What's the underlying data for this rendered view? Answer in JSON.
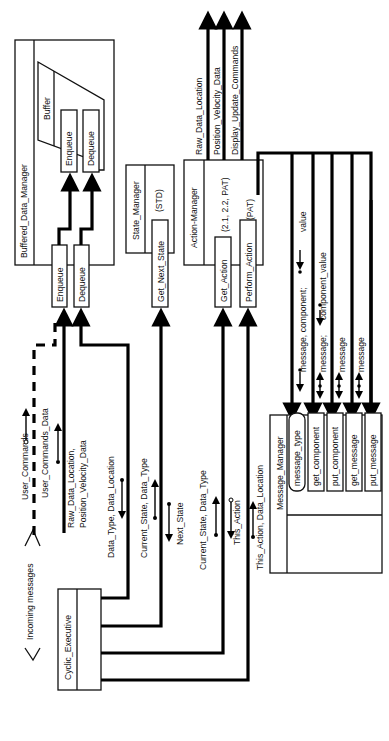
{
  "diagram": {
    "type": "structure-chart",
    "orientation": "rotated-90-ccw",
    "modules": {
      "cyclic_executive": "Cyclic_Executive",
      "buffered_data_manager": "Buffered_Data_Manager",
      "buffer": "Buffer",
      "bdm_enqueue": "Enqueue",
      "bdm_dequeue": "Dequeue",
      "enqueue": "Enqueue",
      "dequeue": "Dequeue",
      "state_manager": "State_Manager",
      "state_manager_note": "(STD)",
      "get_next_state": "Get_Next_State",
      "action_manager": "Action-Manager",
      "action_manager_note1": "(2.1, 2.2, PAT)",
      "action_manager_note2": "(PAT)",
      "get_action": "Get_Action",
      "perform_action": "Perform_Action",
      "message_manager": "Message_Manager",
      "message_type": "message_type",
      "get_component": "get_component",
      "put_component": "put_component",
      "get_message": "get_message",
      "put_message": "put_message"
    },
    "labels": {
      "incoming_messages": "Incoming messages",
      "user_commands": "User_Commands",
      "user_commands_data": "User_Commands_Data",
      "raw_pos_1": "Raw_Data_Location,",
      "raw_pos_2": "Position_Velocity_Data",
      "data_type_location": "Data_Type, Data_Location",
      "current_state_data_type_1": "Current_State, Data_Type",
      "next_state": "Next_State",
      "current_state_data_type_2": "Current_State, Data_Type",
      "this_action": "This_Action",
      "this_action_data_location": "This_Action, Data_Location",
      "out_raw_data_location": "Raw_Data_Location",
      "out_position_velocity_data": "Position_Velocity_Data",
      "out_display_update_commands": "Display_Update_Commands",
      "msg_component_value": "message, component;",
      "value": "value",
      "msg_component_value_2a": "message;",
      "msg_component_value_2b": "component_value",
      "message_1": "message",
      "message_2": "message"
    }
  }
}
